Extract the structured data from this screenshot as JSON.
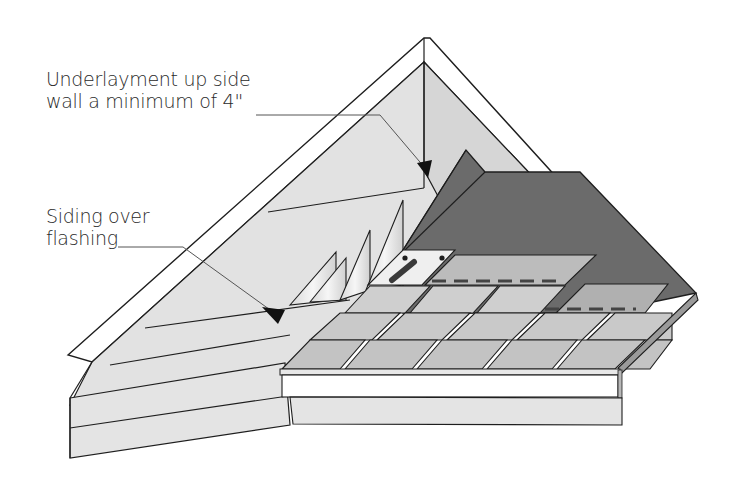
{
  "diagram": {
    "callouts": [
      {
        "id": "underlayment",
        "line1": "Underlayment up side",
        "line2": "wall a minimum of 4\""
      },
      {
        "id": "siding",
        "line1": "Siding over",
        "line2": "flashing"
      }
    ],
    "components": [
      "gable wall siding",
      "step flashing",
      "roof underlayment",
      "asphalt shingles",
      "fascia board",
      "nail"
    ],
    "colors": {
      "background": "#ffffff",
      "outline": "#1e1e1e",
      "siding": "#e4e4e4",
      "gable_upper": "#dedede",
      "underlayment": "#6e6e6e",
      "shingle": "#c8c8c8",
      "shingle_dark": "#b4b4b4",
      "flashing": "#f0f0f0",
      "fascia": "#ffffff",
      "nail": "#3a3a3a",
      "leader_line": "#555555"
    }
  }
}
